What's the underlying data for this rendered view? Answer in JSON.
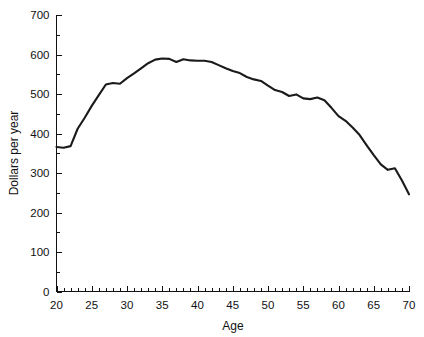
{
  "chart_data": {
    "type": "line",
    "title": "",
    "xlabel": "Age",
    "ylabel": "Dollars per year",
    "xlim": [
      20,
      70
    ],
    "ylim": [
      0,
      700
    ],
    "grid": false,
    "legend": null,
    "x_ticks": [
      20,
      25,
      30,
      35,
      40,
      45,
      50,
      55,
      60,
      65,
      70
    ],
    "x_tick_labels": [
      "20",
      "25",
      "30",
      "35",
      "40",
      "45",
      "50",
      "55",
      "60",
      "65",
      "70"
    ],
    "x_minor_tick_step": 1,
    "y_ticks": [
      0,
      100,
      200,
      300,
      400,
      500,
      600,
      700
    ],
    "y_tick_labels": [
      "0",
      "100",
      "200",
      "300",
      "400",
      "500",
      "600",
      "700"
    ],
    "y_minor_tick_step": 50,
    "line_color": "#1a1a1a",
    "x": [
      20,
      21,
      22,
      23,
      24,
      25,
      26,
      27,
      28,
      29,
      30,
      31,
      32,
      33,
      34,
      35,
      36,
      37,
      38,
      39,
      40,
      41,
      42,
      43,
      44,
      45,
      46,
      47,
      48,
      49,
      50,
      51,
      52,
      53,
      54,
      55,
      56,
      57,
      58,
      59,
      60,
      61,
      62,
      63,
      64,
      65,
      66,
      67,
      68,
      69,
      70
    ],
    "values": [
      366,
      364,
      368,
      412,
      440,
      470,
      497,
      524,
      528,
      526,
      540,
      552,
      565,
      578,
      587,
      590,
      589,
      581,
      588,
      585,
      584,
      584,
      581,
      573,
      565,
      558,
      553,
      543,
      537,
      533,
      521,
      510,
      505,
      495,
      499,
      489,
      487,
      491,
      484,
      465,
      444,
      432,
      415,
      396,
      370,
      345,
      322,
      308,
      312,
      281,
      246
    ]
  },
  "figure": {
    "background_color": "#ffffff",
    "width_px": 424,
    "height_px": 337
  }
}
